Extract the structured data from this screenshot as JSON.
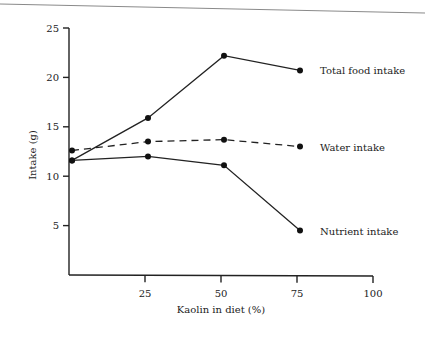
{
  "chart_data": {
    "type": "line",
    "title": "",
    "xlabel": "Kaolin in diet (%)",
    "ylabel": "Intake (g)",
    "xlim": [
      0,
      100
    ],
    "ylim": [
      0,
      25
    ],
    "xticks": [
      25,
      50,
      75,
      100
    ],
    "yticks": [
      5,
      10,
      15,
      20,
      25
    ],
    "grid": false,
    "legend": "inline labels at right end of each series",
    "x": [
      0,
      25,
      50,
      75
    ],
    "series": [
      {
        "name": "Total food intake",
        "style": "solid",
        "values": [
          11.6,
          15.9,
          22.2,
          20.7
        ]
      },
      {
        "name": "Water intake",
        "style": "dashed",
        "values": [
          12.6,
          13.5,
          13.7,
          13.0
        ]
      },
      {
        "name": "Nutrient intake",
        "style": "solid",
        "values": [
          11.6,
          12.0,
          11.1,
          4.5
        ]
      }
    ]
  }
}
